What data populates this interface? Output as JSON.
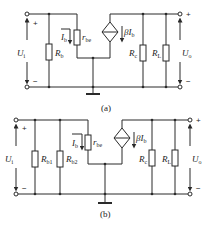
{
  "diagrams": [
    {
      "id": "a",
      "caption": "(a)",
      "input_voltage": {
        "symbol": "U",
        "sub": "i"
      },
      "output_voltage": {
        "symbol": "U",
        "sub": "o"
      },
      "input_plus": "+",
      "input_minus": "−",
      "output_plus": "+",
      "output_minus": "−",
      "components": [
        {
          "symbol": "R",
          "sub": "b",
          "type": "resistor"
        },
        {
          "symbol": "r",
          "sub": "be",
          "type": "resistor"
        },
        {
          "symbol": "βI",
          "sub": "b",
          "type": "dependent-current-source"
        },
        {
          "symbol": "R",
          "sub": "c",
          "type": "resistor"
        },
        {
          "symbol": "R",
          "sub": "L",
          "type": "resistor"
        }
      ],
      "current_label": {
        "symbol": "I",
        "sub": "b"
      }
    },
    {
      "id": "b",
      "caption": "(b)",
      "input_voltage": {
        "symbol": "U",
        "sub": "i"
      },
      "output_voltage": {
        "symbol": "U",
        "sub": "o"
      },
      "input_plus": "+",
      "input_minus": "−",
      "output_plus": "+",
      "output_minus": "−",
      "components": [
        {
          "symbol": "R",
          "sub": "b1",
          "type": "resistor"
        },
        {
          "symbol": "R",
          "sub": "b2",
          "type": "resistor"
        },
        {
          "symbol": "r",
          "sub": "be",
          "type": "resistor"
        },
        {
          "symbol": "βI",
          "sub": "b",
          "type": "dependent-current-source"
        },
        {
          "symbol": "R",
          "sub": "c",
          "type": "resistor"
        },
        {
          "symbol": "R",
          "sub": "L",
          "type": "resistor"
        }
      ],
      "current_label": {
        "symbol": "I",
        "sub": "b"
      }
    }
  ]
}
